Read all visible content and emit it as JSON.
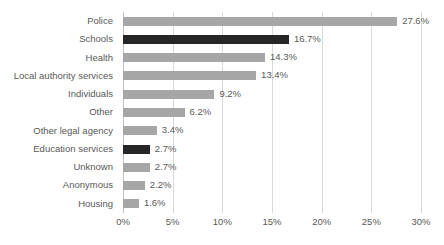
{
  "chart_data": {
    "type": "bar",
    "orientation": "horizontal",
    "title": "",
    "subtitle": "",
    "xlabel": "",
    "ylabel": "",
    "xlim": [
      0,
      30
    ],
    "xticks": [
      "0%",
      "5%",
      "10%",
      "15%",
      "20%",
      "25%",
      "30%"
    ],
    "xtick_values": [
      0,
      5,
      10,
      15,
      20,
      25,
      30
    ],
    "grid": true,
    "legend": "none",
    "value_suffix": "%",
    "categories": [
      "Police",
      "Schools",
      "Health",
      "Local authority services",
      "Individuals",
      "Other",
      "Other legal agency",
      "Education services",
      "Unknown",
      "Anonymous",
      "Housing"
    ],
    "values": [
      27.6,
      16.7,
      14.3,
      13.4,
      9.2,
      6.2,
      3.4,
      2.7,
      2.7,
      2.2,
      1.6
    ],
    "value_labels": [
      "27.6%",
      "16.7%",
      "14.3%",
      "13.4%",
      "9.2%",
      "6.2%",
      "3.4%",
      "2.7%",
      "2.7%",
      "2.2%",
      "1.6%"
    ],
    "highlighted": [
      false,
      true,
      false,
      false,
      false,
      false,
      false,
      true,
      false,
      false,
      false
    ],
    "colors": {
      "bar_default": "#a6a6a6",
      "bar_highlight": "#262626",
      "gridline": "#d9d9d9",
      "axis": "#bfbfbf",
      "text": "#595959",
      "background": "#ffffff"
    }
  }
}
